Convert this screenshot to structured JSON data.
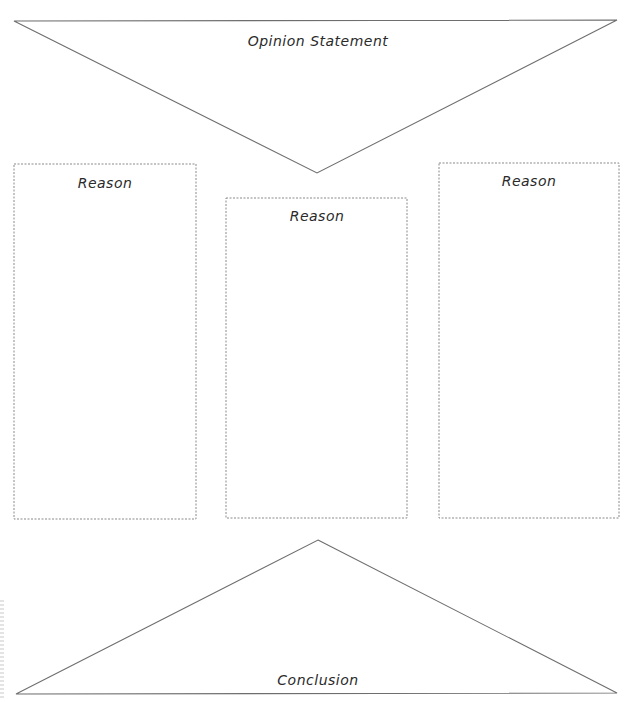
{
  "worksheet": {
    "type": "Opinion writing graphic organizer",
    "opinion": {
      "label": "Opinion Statement"
    },
    "reasons": [
      {
        "label": "Reason"
      },
      {
        "label": "Reason"
      },
      {
        "label": "Reason"
      }
    ],
    "conclusion": {
      "label": "Conclusion"
    },
    "colors": {
      "line": "#6e6e6e",
      "box_border": "#8a8a8a",
      "text": "#2a2a2a",
      "background": "#ffffff"
    }
  }
}
